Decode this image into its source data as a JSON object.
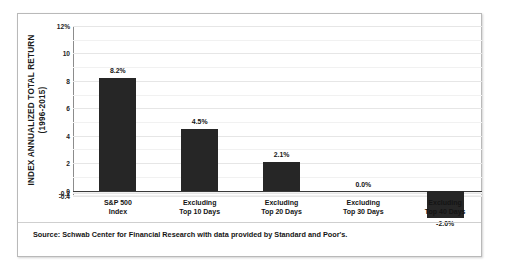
{
  "chart_data": {
    "type": "bar",
    "title": "",
    "subtitle": "",
    "xlabel": "",
    "ylabel": "INDEX ANNUALIZED TOTAL RETURN (1996-2015)",
    "ylabel_lines": [
      "INDEX ANNUALIZED TOTAL RETURN",
      "(1996-2015)"
    ],
    "categories": [
      "S&P 500 Index",
      "Excluding Top 10 Days",
      "Excluding Top 20 Days",
      "Excluding Top 30 Days",
      "Excluding Top 40 Days"
    ],
    "category_lines": [
      [
        "S&P 500",
        "Index"
      ],
      [
        "Excluding",
        "Top 10 Days"
      ],
      [
        "Excluding",
        "Top 20 Days"
      ],
      [
        "Excluding",
        "Top 30 Days"
      ],
      [
        "Excluding",
        "Top 40 Days"
      ]
    ],
    "values": [
      8.2,
      4.5,
      2.1,
      0.0,
      -2.0
    ],
    "data_labels": [
      "8.2%",
      "4.5%",
      "2.1%",
      "0.0%",
      "-2.0%"
    ],
    "ylim": [
      -0.4,
      12
    ],
    "ytick_values": [
      12,
      10,
      8,
      6,
      4,
      2,
      0,
      -0.2,
      -0.4
    ],
    "ytick_labels": [
      "12%",
      "10",
      "8",
      "6",
      "4",
      "2",
      "0",
      "-0.2",
      "-0.4"
    ],
    "grid": true,
    "minor_grid": true,
    "legend": "none",
    "bar_color": "#262626",
    "gridline_color": "#e6e6e6",
    "axis_color": "#8c8c8c"
  },
  "footnote": {
    "source": "Source: Schwab Center for Financial Research with data provided by Standard and Poor's."
  }
}
